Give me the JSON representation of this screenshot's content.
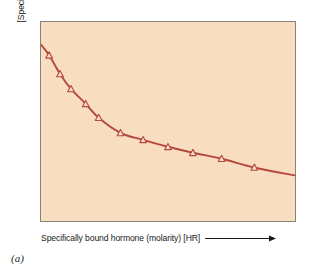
{
  "figure": {
    "panel_caption": "(a)",
    "background_color": "#ffffff",
    "plot_background_color": "#f8ddc0",
    "frame_color": "#8a8078",
    "curve_color": "#b5483c",
    "marker_color": "#b5483c",
    "text_color": "#1a1a1a"
  },
  "axes": {
    "y_label": "[Specifically bound hormone] / [free hormone]",
    "x_label": "Specifically bound hormone (molarity) [HR]",
    "x_arrow_icon": "right-arrow-icon",
    "x_ticks": [],
    "y_ticks": [],
    "grid": false
  },
  "chart_data": {
    "type": "line",
    "title": "",
    "subtitle": "",
    "xlabel": "Specifically bound hormone (molarity) [HR]",
    "ylabel": "[Specifically bound hormone] / [free hormone]",
    "xlim": [
      0,
      100
    ],
    "ylim": [
      0,
      100
    ],
    "grid": false,
    "legend": null,
    "marker": "triangle-up-open",
    "annotations": [
      "(a)"
    ],
    "series": [
      {
        "name": "Scatchard curve",
        "color": "#b5483c",
        "x": [
          0.0,
          3.2,
          7.5,
          11.8,
          17.6,
          22.7,
          31.3,
          40.2,
          50.0,
          59.8,
          71.1,
          84.0,
          100.0
        ],
        "y": [
          88.6,
          83.3,
          73.9,
          66.4,
          58.9,
          51.9,
          44.3,
          40.8,
          37.3,
          34.3,
          31.3,
          26.9,
          22.9
        ]
      }
    ],
    "markers_x": [
      3.2,
      7.5,
      11.8,
      17.6,
      22.7,
      31.3,
      40.2,
      50.0,
      59.8,
      71.1,
      84.0
    ],
    "markers_y": [
      83.3,
      73.9,
      66.4,
      58.9,
      51.9,
      44.3,
      40.8,
      37.3,
      34.3,
      31.3,
      26.9
    ],
    "knee_point": {
      "x": 31.3,
      "y": 44.3
    }
  }
}
